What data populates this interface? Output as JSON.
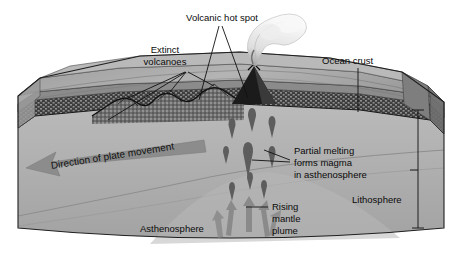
{
  "figure": {
    "type": "geology-block-diagram",
    "background_color": "#ffffff"
  },
  "labels": {
    "volcanic_hot_spot": "Volcanic hot spot",
    "extinct_volcanoes_line1": "Extinct",
    "extinct_volcanoes_line2": "volcanoes",
    "ocean_crust": "Ocean crust",
    "partial_melting_line1": "Partial melting",
    "partial_melting_line2": "forms magma",
    "partial_melting_line3": "in asthenosphere",
    "lithosphere": "Lithosphere",
    "rising_plume_line1": "Rising",
    "rising_plume_line2": "mantle",
    "rising_plume_line3": "plume",
    "asthenosphere": "Asthenosphere",
    "plate_movement": "Direction of plate movement"
  },
  "layers": [
    {
      "name": "ocean-surface",
      "color": "#a9a9a9"
    },
    {
      "name": "ocean-crust",
      "color": "#8d8d8d"
    },
    {
      "name": "lithospheric-mantle",
      "color": "#3f3f3f"
    },
    {
      "name": "asthenosphere",
      "color": "#b2b2b2"
    },
    {
      "name": "deep-asthenosphere",
      "color": "#a0a0a0"
    }
  ],
  "colors": {
    "line": "#111111",
    "arrow_gray": "#8a8a8a",
    "magma_blob": "#606060",
    "smoke_plume": "#f2f2f2",
    "volcano_dark": "#1d1d1d"
  },
  "icon_names": [
    "volcano-eruption-icon",
    "smoke-plume-icon",
    "magma-blob-icon",
    "rising-arrow-icon",
    "plate-movement-arrow-icon",
    "lithosphere-bracket-icon",
    "leader-line-icon"
  ]
}
